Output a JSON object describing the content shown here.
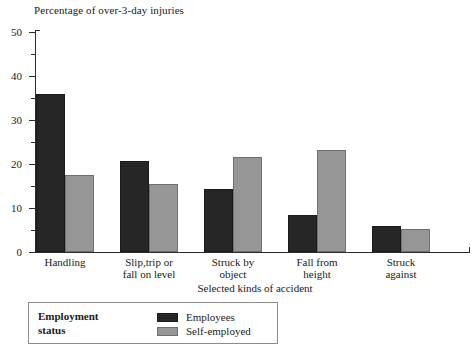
{
  "chart_data": {
    "type": "bar",
    "title": "Percentage of over-3-day injuries",
    "xlabel": "Selected kinds of accident",
    "ylabel": "",
    "ylim": [
      0,
      50
    ],
    "ytick_values": [
      0,
      10,
      20,
      30,
      40,
      50
    ],
    "ytick_labels": [
      "0",
      "10",
      "20",
      "30",
      "40",
      "50"
    ],
    "yminor_values": [
      5,
      15,
      25,
      35,
      45
    ],
    "grid": false,
    "legend_position": "below-left",
    "categories": [
      "Handling",
      "Slip,trip or\nfall on level",
      "Struck by\nobject",
      "Fall from\nheight",
      "Struck\nagainst"
    ],
    "series": [
      {
        "name": "Employees",
        "color": "#262626",
        "values": [
          36,
          20.7,
          14.3,
          8.5,
          6
        ]
      },
      {
        "name": "Self-employed",
        "color": "#969696",
        "values": [
          17.5,
          15.5,
          21.5,
          23.2,
          5.3
        ]
      }
    ]
  },
  "legend": {
    "title": "Employment\nstatus",
    "entries": [
      {
        "label": "Employees",
        "swatch": "employees"
      },
      {
        "label": "Self-employed",
        "swatch": "selfemployed"
      }
    ]
  }
}
